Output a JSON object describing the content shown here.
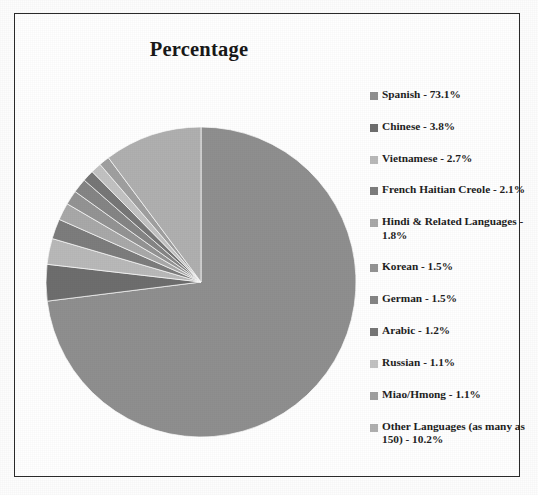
{
  "chart_data": {
    "type": "pie",
    "title": "Percentage",
    "xlabel": "",
    "ylabel": "",
    "legend_position": "right",
    "grid": false,
    "start_angle_deg": 0,
    "direction": "clockwise",
    "categories": [
      "Spanish",
      "Chinese",
      "Vietnamese",
      "French Haitian Creole",
      "Hindi & Related Languages",
      "Korean",
      "German",
      "Arabic",
      "Russian",
      "Miao/Hmong",
      "Other Languages (as many as 150)"
    ],
    "values": [
      73.1,
      3.8,
      2.7,
      2.1,
      1.8,
      1.5,
      1.5,
      1.2,
      1.1,
      1.1,
      10.2
    ],
    "unit": "%",
    "colors": [
      "#8f8f8f",
      "#6e6e6e",
      "#b9b9b9",
      "#7d7d7d",
      "#a9a9a9",
      "#949494",
      "#858585",
      "#777777",
      "#c2c2c2",
      "#a0a0a0",
      "#b0b0b0"
    ],
    "legend_entries": [
      "Spanish - 73.1%",
      "Chinese - 3.8%",
      "Vietnamese - 2.7%",
      "French Haitian Creole - 2.1%",
      "Hindi & Related Languages - 1.8%",
      "Korean - 1.5%",
      "German - 1.5%",
      "Arabic - 1.2%",
      "Russian - 1.1%",
      "Miao/Hmong - 1.1%",
      "Other Languages (as many as 150) - 10.2%"
    ]
  },
  "frame": {
    "border_color": "#2b2b2b",
    "background": "#ffffff"
  }
}
